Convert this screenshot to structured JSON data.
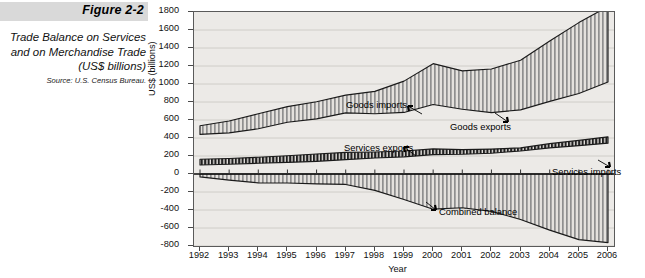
{
  "figure": {
    "number": "Figure 2-2",
    "title": "Trade Balance on Services\nand on Merchandise Trade\n(US$ billions)",
    "title_lines": [
      "Trade Balance on Services",
      "and on Merchandise Trade",
      "(US$ billions)"
    ],
    "source": "Source: U.S. Census Bureau."
  },
  "chart_data": {
    "type": "area",
    "title": "Trade Balance on Services and on Merchandise Trade (US$ billions)",
    "xlabel": "Year",
    "ylabel": "US$ (billions)",
    "ylim": [
      -800,
      1800
    ],
    "ytick_step": 200,
    "yticks": [
      1800,
      1600,
      1400,
      1200,
      1000,
      800,
      600,
      400,
      200,
      0,
      -200,
      -400,
      -600,
      -800
    ],
    "ytick_labels": [
      "1800",
      "1600",
      "1400",
      "1200",
      "1000",
      "800",
      "600",
      "400",
      "200",
      "0",
      "-200",
      "-400",
      "-600",
      "-800"
    ],
    "xlim": [
      1992,
      2006
    ],
    "grid": true,
    "legend_position": "inline-annotations",
    "categories": [
      1992,
      1993,
      1994,
      1995,
      1996,
      1997,
      1998,
      1999,
      2000,
      2001,
      2002,
      2003,
      2004,
      2005,
      2006
    ],
    "x": [
      "1992",
      "1993",
      "1994",
      "1995",
      "1996",
      "1997",
      "1998",
      "1999",
      "2000",
      "2001",
      "2002",
      "2003",
      "2004",
      "2005",
      "2006"
    ],
    "series": [
      {
        "name": "Goods imports",
        "fill": "vertical-hatch-light",
        "values": [
          536,
          589,
          669,
          749,
          803,
          876,
          918,
          1032,
          1226,
          1146,
          1167,
          1264,
          1477,
          1682,
          1861
        ]
      },
      {
        "name": "Goods exports",
        "fill": "line",
        "values": [
          440,
          457,
          503,
          575,
          612,
          679,
          670,
          684,
          772,
          719,
          682,
          713,
          807,
          895,
          1023
        ]
      },
      {
        "name": "Services imports",
        "fill": "line",
        "values": [
          100,
          108,
          119,
          129,
          141,
          159,
          178,
          191,
          216,
          219,
          231,
          256,
          291,
          315,
          343
        ]
      },
      {
        "name": "Services exports",
        "fill": "vertical-hatch-dark",
        "values": [
          164,
          172,
          186,
          203,
          222,
          240,
          244,
          255,
          279,
          271,
          277,
          290,
          337,
          373,
          413
        ]
      },
      {
        "name": "Combined balance",
        "fill": "vertical-hatch-light",
        "values": [
          -32,
          -68,
          -99,
          -100,
          -110,
          -116,
          -182,
          -284,
          -391,
          -375,
          -415,
          -505,
          -624,
          -729,
          -762
        ]
      }
    ],
    "annotations": [
      {
        "text": "Goods imports",
        "target_series": "Goods imports"
      },
      {
        "text": "Goods exports",
        "target_series": "Goods exports"
      },
      {
        "text": "Services exports",
        "target_series": "Services exports"
      },
      {
        "text": "Services imports",
        "target_series": "Services imports"
      },
      {
        "text": "Combined balance",
        "target_series": "Combined balance"
      }
    ]
  },
  "colors": {
    "plot_background": "#eceae7",
    "banner": "#d9d9d9",
    "axis": "#4a4a4a",
    "gridline": "#c9c6c2",
    "series_line": "#1a1a1a",
    "hatch_light": "#8f8f8f",
    "hatch_dark": "#1f1f1f"
  }
}
